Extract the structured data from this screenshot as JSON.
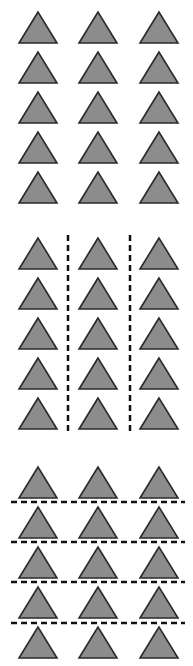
{
  "figure": {
    "width": 193,
    "height": 666,
    "triangle_fill": "#8c8c8c",
    "triangle_stroke": "#2a2a2a",
    "divider_color": "#111111",
    "triangle_half_width": 19,
    "triangle_height": 31,
    "column_centers": [
      38,
      98,
      159
    ],
    "panels": [
      {
        "name": "ungrouped",
        "rows": 5,
        "cols": 3,
        "row_apex_y": [
          12,
          52,
          92,
          132,
          172
        ],
        "dividers": []
      },
      {
        "name": "grouped-by-columns",
        "rows": 5,
        "cols": 3,
        "row_apex_y": [
          238,
          278,
          318,
          358,
          398
        ],
        "dividers": [
          {
            "orientation": "vertical",
            "x": 68,
            "y1": 235,
            "y2": 435
          },
          {
            "orientation": "vertical",
            "x": 130,
            "y1": 235,
            "y2": 435
          }
        ]
      },
      {
        "name": "grouped-by-rows",
        "rows": 5,
        "cols": 3,
        "row_apex_y": [
          467,
          507,
          547,
          587,
          627
        ],
        "dividers": [
          {
            "orientation": "horizontal",
            "y": 502,
            "x1": 11,
            "x2": 185
          },
          {
            "orientation": "horizontal",
            "y": 542,
            "x1": 11,
            "x2": 185
          },
          {
            "orientation": "horizontal",
            "y": 582,
            "x1": 11,
            "x2": 185
          },
          {
            "orientation": "horizontal",
            "y": 623,
            "x1": 11,
            "x2": 185
          }
        ]
      }
    ]
  }
}
